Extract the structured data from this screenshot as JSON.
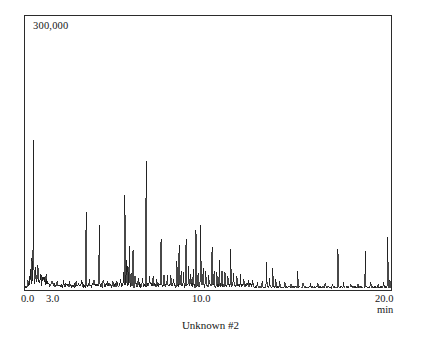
{
  "figure": {
    "caption": "Unknown #2",
    "background_color": "#ffffff",
    "frame_color": "#2b2b2b",
    "trace_color": "#1a1a1a"
  },
  "axes": {
    "y_scale_label": "300,000",
    "x_unit_label": "min",
    "x_tick_labels": [
      "0.0",
      "3.0",
      "10.0",
      "20.0"
    ]
  },
  "chart_data": {
    "type": "line",
    "title": "Unknown #2",
    "xlabel": "min",
    "ylabel": "300,000",
    "xlim": [
      0.0,
      20.0
    ],
    "ylim": [
      0,
      300000
    ],
    "grid": false,
    "legend": null,
    "annotations": [
      "300,000"
    ],
    "x_ticks": [
      0.0,
      3.0,
      10.0,
      20.0
    ],
    "x_tick_labels": [
      "0.0",
      "3.0",
      "10.0",
      "20.0"
    ],
    "series": [
      {
        "name": "Unknown #2 total ion chromatogram",
        "peaks": [
          {
            "x": 0.3,
            "y": 18000
          },
          {
            "x": 0.38,
            "y": 26000
          },
          {
            "x": 0.46,
            "y": 163000
          },
          {
            "x": 0.58,
            "y": 21000
          },
          {
            "x": 0.7,
            "y": 13000
          },
          {
            "x": 0.84,
            "y": 9000
          },
          {
            "x": 1.0,
            "y": 7000
          },
          {
            "x": 1.22,
            "y": 5500
          },
          {
            "x": 1.48,
            "y": 5000
          },
          {
            "x": 1.76,
            "y": 4500
          },
          {
            "x": 2.1,
            "y": 4200
          },
          {
            "x": 2.45,
            "y": 4000
          },
          {
            "x": 2.8,
            "y": 4500
          },
          {
            "x": 3.1,
            "y": 5000
          },
          {
            "x": 3.34,
            "y": 84000
          },
          {
            "x": 3.52,
            "y": 9000
          },
          {
            "x": 3.78,
            "y": 6000
          },
          {
            "x": 4.06,
            "y": 70000
          },
          {
            "x": 4.26,
            "y": 7000
          },
          {
            "x": 4.52,
            "y": 6000
          },
          {
            "x": 4.8,
            "y": 5500
          },
          {
            "x": 5.02,
            "y": 6500
          },
          {
            "x": 5.22,
            "y": 8000
          },
          {
            "x": 5.38,
            "y": 14000
          },
          {
            "x": 5.46,
            "y": 103000
          },
          {
            "x": 5.54,
            "y": 30000
          },
          {
            "x": 5.62,
            "y": 22000
          },
          {
            "x": 5.7,
            "y": 47000
          },
          {
            "x": 5.8,
            "y": 18000
          },
          {
            "x": 5.9,
            "y": 43000
          },
          {
            "x": 6.02,
            "y": 12000
          },
          {
            "x": 6.2,
            "y": 9000
          },
          {
            "x": 6.42,
            "y": 8000
          },
          {
            "x": 6.62,
            "y": 140000
          },
          {
            "x": 6.8,
            "y": 11000
          },
          {
            "x": 7.0,
            "y": 9000
          },
          {
            "x": 7.2,
            "y": 8000
          },
          {
            "x": 7.44,
            "y": 55000
          },
          {
            "x": 7.6,
            "y": 13000
          },
          {
            "x": 7.78,
            "y": 10000
          },
          {
            "x": 7.96,
            "y": 14000
          },
          {
            "x": 8.12,
            "y": 9000
          },
          {
            "x": 8.3,
            "y": 27000
          },
          {
            "x": 8.42,
            "y": 48000
          },
          {
            "x": 8.54,
            "y": 20000
          },
          {
            "x": 8.66,
            "y": 14000
          },
          {
            "x": 8.8,
            "y": 52000
          },
          {
            "x": 8.94,
            "y": 24000
          },
          {
            "x": 9.06,
            "y": 16000
          },
          {
            "x": 9.2,
            "y": 20000
          },
          {
            "x": 9.34,
            "y": 64000
          },
          {
            "x": 9.46,
            "y": 18000
          },
          {
            "x": 9.6,
            "y": 70000
          },
          {
            "x": 9.74,
            "y": 22000
          },
          {
            "x": 9.88,
            "y": 15000
          },
          {
            "x": 10.04,
            "y": 12000
          },
          {
            "x": 10.22,
            "y": 46000
          },
          {
            "x": 10.34,
            "y": 20000
          },
          {
            "x": 10.48,
            "y": 16000
          },
          {
            "x": 10.62,
            "y": 26000
          },
          {
            "x": 10.76,
            "y": 19000
          },
          {
            "x": 10.92,
            "y": 17000
          },
          {
            "x": 11.08,
            "y": 14000
          },
          {
            "x": 11.24,
            "y": 44000
          },
          {
            "x": 11.4,
            "y": 18000
          },
          {
            "x": 11.58,
            "y": 12000
          },
          {
            "x": 11.78,
            "y": 14000
          },
          {
            "x": 11.96,
            "y": 10000
          },
          {
            "x": 12.2,
            "y": 9000
          },
          {
            "x": 12.44,
            "y": 8000
          },
          {
            "x": 12.7,
            "y": 7000
          },
          {
            "x": 12.96,
            "y": 6500
          },
          {
            "x": 13.2,
            "y": 30000
          },
          {
            "x": 13.36,
            "y": 11000
          },
          {
            "x": 13.54,
            "y": 23000
          },
          {
            "x": 13.7,
            "y": 9000
          },
          {
            "x": 13.92,
            "y": 7000
          },
          {
            "x": 14.2,
            "y": 6000
          },
          {
            "x": 14.52,
            "y": 5500
          },
          {
            "x": 14.9,
            "y": 20000
          },
          {
            "x": 15.2,
            "y": 6000
          },
          {
            "x": 15.6,
            "y": 5000
          },
          {
            "x": 16.0,
            "y": 4800
          },
          {
            "x": 16.4,
            "y": 4600
          },
          {
            "x": 16.8,
            "y": 4500
          },
          {
            "x": 17.1,
            "y": 43000
          },
          {
            "x": 17.4,
            "y": 5000
          },
          {
            "x": 17.8,
            "y": 4600
          },
          {
            "x": 18.2,
            "y": 4400
          },
          {
            "x": 18.6,
            "y": 42000
          },
          {
            "x": 18.9,
            "y": 5000
          },
          {
            "x": 19.3,
            "y": 4500
          },
          {
            "x": 19.6,
            "y": 6000
          },
          {
            "x": 19.82,
            "y": 57000
          },
          {
            "x": 19.94,
            "y": 9000
          }
        ]
      }
    ]
  }
}
